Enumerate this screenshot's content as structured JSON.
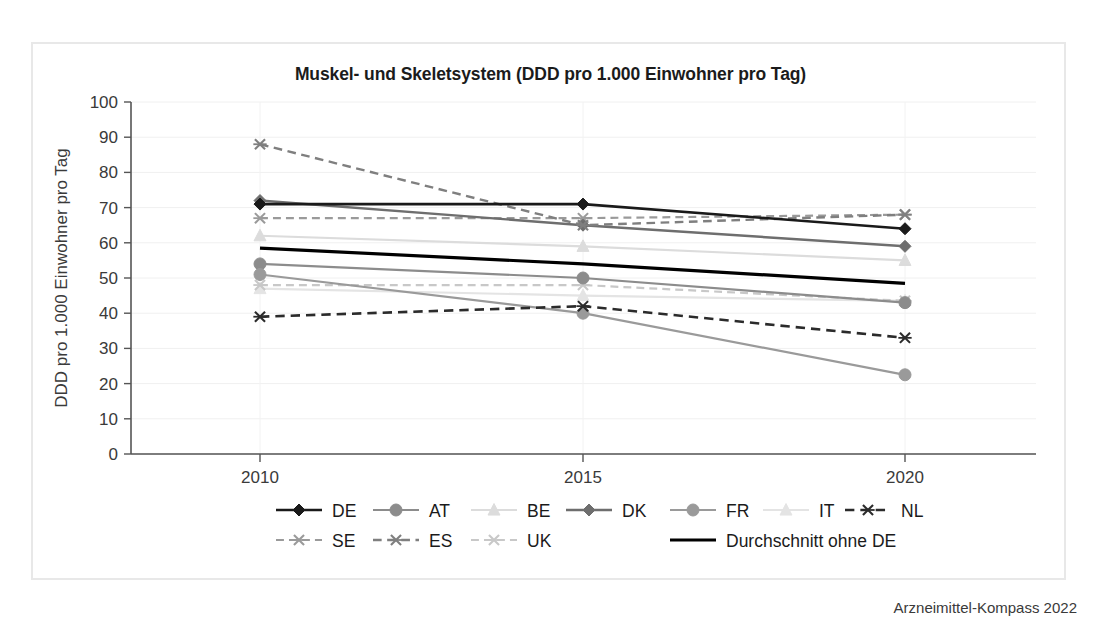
{
  "frame": {
    "border_color": "#e8e8e8"
  },
  "footer": {
    "text": "Arzneimittel-Kompass 2022"
  },
  "chart_data": {
    "type": "line",
    "title": "Muskel- und Skeletsystem (DDD pro 1.000 Einwohner pro Tag)",
    "xlabel": "",
    "ylabel": "DDD pro 1.000 Einwohner pro Tag",
    "categories": [
      "2010",
      "2015",
      "2020"
    ],
    "x": [
      2010,
      2015,
      2020
    ],
    "ylim": [
      0,
      100
    ],
    "yticks": [
      0,
      10,
      20,
      30,
      40,
      50,
      60,
      70,
      80,
      90,
      100
    ],
    "ytick_labels": [
      "0",
      "10",
      "20",
      "30",
      "40",
      "50",
      "60",
      "70",
      "80",
      "90",
      "100"
    ],
    "grid": true,
    "legend_position": "bottom",
    "series": [
      {
        "name": "DE",
        "values": [
          71,
          71,
          64
        ],
        "color": "#1a1a1a",
        "dash": "solid",
        "marker": "diamond",
        "width": 2.6
      },
      {
        "name": "AT",
        "values": [
          54,
          50,
          43
        ],
        "color": "#8c8c8c",
        "dash": "solid",
        "marker": "circle",
        "width": 2.2
      },
      {
        "name": "BE",
        "values": [
          62,
          59,
          55
        ],
        "color": "#dcdcdc",
        "dash": "solid",
        "marker": "triangle",
        "width": 2.2
      },
      {
        "name": "DK",
        "values": [
          72,
          65,
          59
        ],
        "color": "#6e6e6e",
        "dash": "solid",
        "marker": "diamond",
        "width": 2.4
      },
      {
        "name": "FR",
        "values": [
          51,
          40,
          22.5
        ],
        "color": "#9a9a9a",
        "dash": "solid",
        "marker": "circle",
        "width": 2.2
      },
      {
        "name": "IT",
        "values": [
          47,
          45,
          43.5
        ],
        "color": "#e4e4e4",
        "dash": "solid",
        "marker": "triangle",
        "width": 2.2
      },
      {
        "name": "NL",
        "values": [
          39,
          42,
          33
        ],
        "color": "#2b2b2b",
        "dash": "dashed",
        "marker": "asterisk",
        "width": 2.6
      },
      {
        "name": "SE",
        "values": [
          67,
          67,
          68
        ],
        "color": "#9a9a9a",
        "dash": "dashed",
        "marker": "asterisk",
        "width": 2.2
      },
      {
        "name": "ES",
        "values": [
          88,
          65,
          68
        ],
        "color": "#7f7f7f",
        "dash": "dashed",
        "marker": "asterisk",
        "width": 2.4
      },
      {
        "name": "UK",
        "values": [
          48,
          48,
          43.5
        ],
        "color": "#c8c8c8",
        "dash": "dashed",
        "marker": "asterisk",
        "width": 2.2
      },
      {
        "name": "Durchschnitt ohne DE",
        "values": [
          58.5,
          54,
          48.5
        ],
        "color": "#000000",
        "dash": "solid",
        "marker": "none",
        "width": 3.2
      }
    ],
    "legend_rows": [
      [
        "DE",
        "AT",
        "BE",
        "DK",
        "FR",
        "IT",
        "NL"
      ],
      [
        "SE",
        "ES",
        "UK",
        "Durchschnitt ohne DE"
      ]
    ]
  }
}
